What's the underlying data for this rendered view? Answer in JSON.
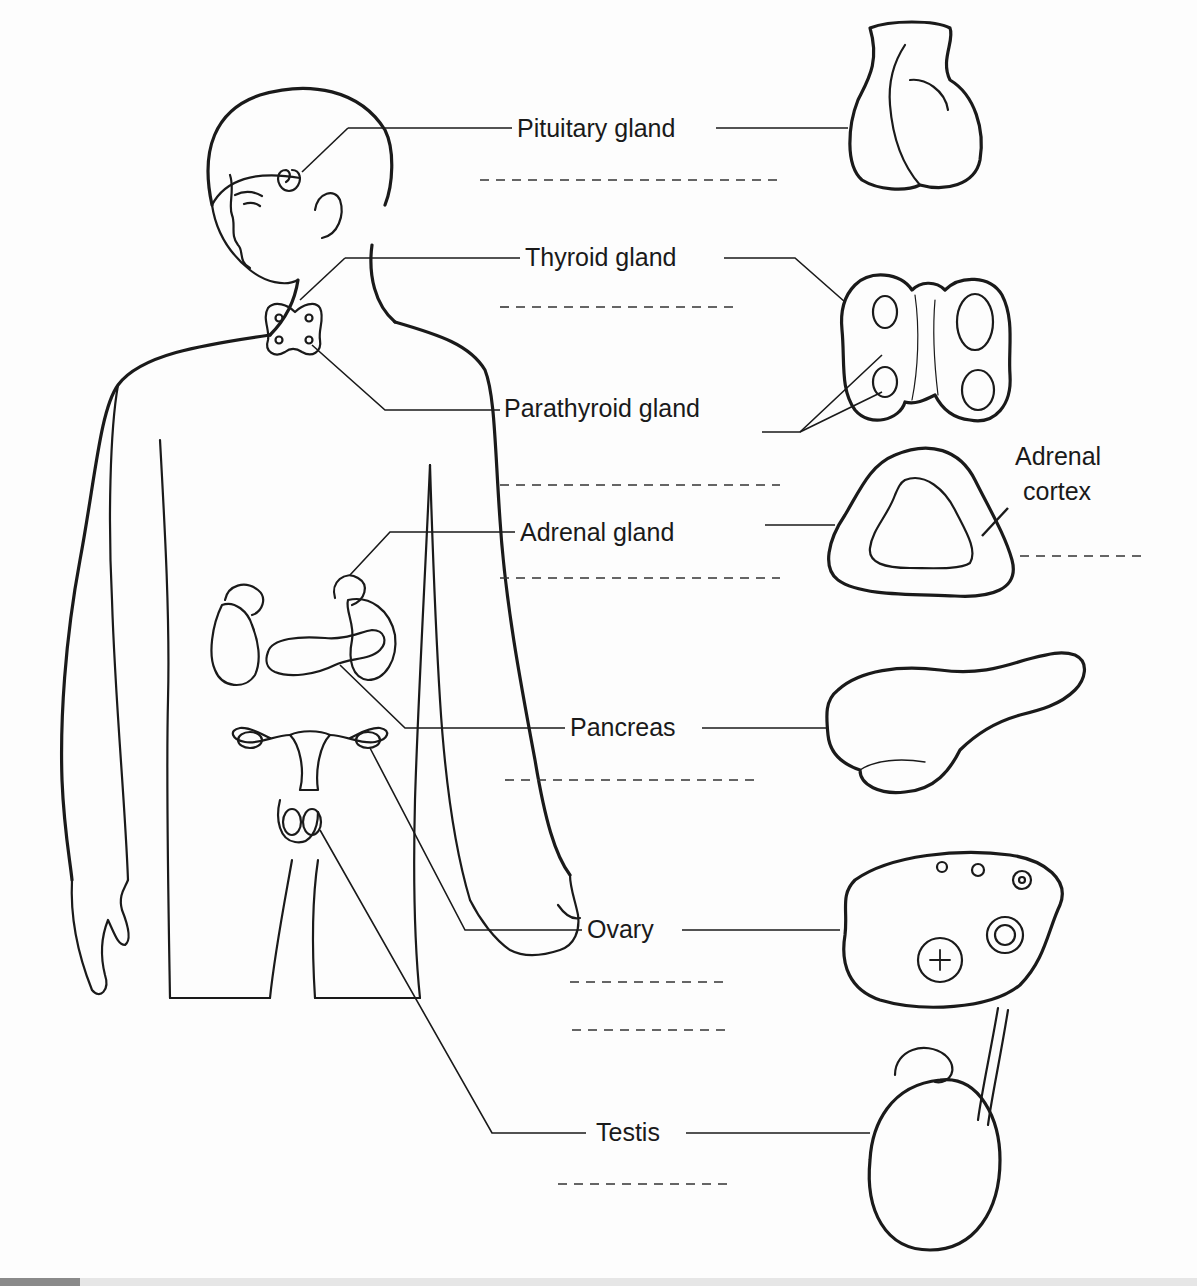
{
  "diagram": {
    "labels": {
      "pituitary": "Pituitary gland",
      "thyroid": "Thyroid gland",
      "parathyroid": "Parathyroid gland",
      "adrenal": "Adrenal gland",
      "adrenal_cortex_line1": "Adrenal",
      "adrenal_cortex_line2": "cortex",
      "pancreas": "Pancreas",
      "ovary": "Ovary",
      "testis": "Testis"
    },
    "blank_answer_lines": 10,
    "colors": {
      "ink": "#1a1a1a",
      "paper": "#fdfdfd"
    }
  }
}
